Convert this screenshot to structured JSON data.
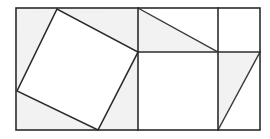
{
  "figure": {
    "canvas": {
      "width": 270,
      "height": 139,
      "background": "#ffffff"
    },
    "colors": {
      "stroke": "#2b2b2b",
      "stroke_secondary": "#3a3a3a",
      "fill_shaded": "#f2f2f2",
      "fill_white": "#ffffff"
    },
    "outer_rectangle": {
      "name": "outer-rectangle",
      "x": 16,
      "y": 8,
      "width": 244,
      "height": 122,
      "corners": [
        [
          16,
          8
        ],
        [
          260,
          8
        ],
        [
          260,
          130
        ],
        [
          16,
          130
        ]
      ]
    },
    "vertical_lines": [
      {
        "name": "vertical-divider-left",
        "x": 138,
        "y1": 8,
        "y2": 130
      },
      {
        "name": "vertical-divider-right",
        "x": 218,
        "y1": 8,
        "y2": 130
      }
    ],
    "horizontal_lines": [
      {
        "name": "horizontal-divider",
        "y": 52,
        "x1": 138,
        "x2": 260
      }
    ],
    "tilted_square": {
      "name": "tilted-square",
      "vertices": [
        [
          17,
          91
        ],
        [
          57,
          9
        ],
        [
          138,
          52
        ],
        [
          98,
          130
        ]
      ],
      "points": "17,91 57,9 138,52 98,130"
    },
    "diagonals": [
      {
        "name": "diagonal-top-middle",
        "x1": 138,
        "y1": 8,
        "x2": 218,
        "y2": 52
      },
      {
        "name": "diagonal-bottom-right",
        "x1": 218,
        "y1": 130,
        "x2": 260,
        "y2": 52
      }
    ],
    "shaded_regions": [
      {
        "name": "region-left-upper-triangle",
        "points": "16,8 57,9 17,91"
      },
      {
        "name": "region-left-lower-triangle",
        "points": "17,91 98,130 16,130"
      },
      {
        "name": "region-left-right-triangle",
        "points": "57,9 138,8 138,52"
      },
      {
        "name": "region-left-bottom-triangle",
        "points": "98,130 138,52 138,130"
      },
      {
        "name": "region-top-middle-triangle",
        "points": "138,8 218,52 138,52"
      },
      {
        "name": "region-bottom-right-triangle",
        "points": "218,52 260,52 218,130"
      }
    ],
    "white_regions": [
      {
        "name": "region-inscribed-square",
        "points": "17,91 57,9 138,52 98,130"
      },
      {
        "name": "region-middle-lower-square",
        "points": "138,52 218,52 218,130 138,130"
      },
      {
        "name": "region-top-right-square",
        "points": "218,8 260,8 260,52 218,52"
      },
      {
        "name": "region-bottom-right-upper-triangle",
        "points": "218,52 260,52 260,130 218,130"
      }
    ]
  }
}
